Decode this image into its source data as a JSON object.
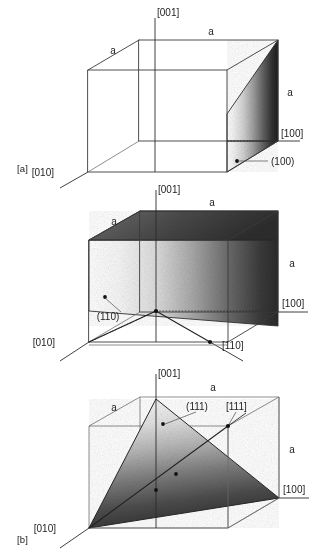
{
  "figure": {
    "background_color": "#ffffff",
    "line_color": "#3a3a3a",
    "text_color": "#1d1d1d",
    "panel_count": 3
  },
  "panels": [
    {
      "tag": "[a]",
      "plane_label": "(100)",
      "lattice_param_labels": [
        "a",
        "a",
        "a"
      ],
      "direction_labels": [
        "[001]",
        "[010]",
        "[100]"
      ],
      "shading": {
        "description": "vertical (100) face shaded with left-to-right light-to-dark gradient",
        "light": "#fdfdfd",
        "dark": "#232323"
      }
    },
    {
      "tag": "[b]",
      "plane_label": "(110)",
      "lattice_param_labels": [
        "a",
        "a",
        "a"
      ],
      "direction_labels": [
        "[001]",
        "[010]",
        "[100]",
        "[110]"
      ],
      "shading": {
        "description": "diagonal (110) plane shaded light-to-dark left to right",
        "light": "#fcfcfc",
        "dark": "#2a2a2a"
      }
    },
    {
      "tag": "[c]",
      "plane_label": "(111)",
      "lattice_param_labels": [
        "a",
        "a",
        "a"
      ],
      "direction_labels": [
        "[001]",
        "[010]",
        "[100]",
        "[111]"
      ],
      "shading": {
        "description": "triangular (111) plane shaded light at apex to dark at base",
        "light": "#f2f2f2",
        "dark": "#2b2b2b"
      }
    }
  ],
  "panel_a": {
    "tag": "[a]",
    "axis_001": "[001]",
    "axis_010": "[010]",
    "axis_100": "[100]",
    "a_top_back": "a",
    "a_top_front": "a",
    "a_right": "a",
    "plane": "(100)"
  },
  "panel_b": {
    "tag": "[b]",
    "axis_001": "[001]",
    "axis_010": "[010]",
    "axis_100": "[100]",
    "axis_110": "[110]",
    "a_top_back": "a",
    "a_top_front": "a",
    "a_right": "a",
    "plane": "(110)"
  },
  "panel_c": {
    "tag": "[c]",
    "axis_001": "[001]",
    "axis_010": "[010]",
    "axis_100": "[100]",
    "axis_111": "[111]",
    "a_top_back": "a",
    "a_top_front": "a",
    "a_right": "a",
    "plane": "(111)"
  }
}
